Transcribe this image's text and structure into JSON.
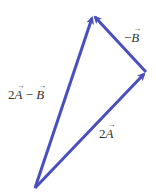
{
  "diagram": {
    "type": "vector-triangle",
    "color": "#4a4fc0",
    "points": {
      "origin": [
        35,
        188
      ],
      "right": [
        146,
        72
      ],
      "top": [
        93,
        15
      ]
    },
    "vectors": [
      {
        "id": "two_a",
        "from": "origin",
        "to": "right"
      },
      {
        "id": "neg_b",
        "from": "right",
        "to": "top"
      },
      {
        "id": "resultant",
        "from": "origin",
        "to": "top"
      }
    ],
    "labels": {
      "resultant": {
        "coef": "2",
        "v1": "A",
        "op": " − ",
        "v2": "B"
      },
      "neg_b": {
        "sign": "−",
        "v": "B"
      },
      "two_a": {
        "coef": "2",
        "v": "A"
      }
    }
  }
}
